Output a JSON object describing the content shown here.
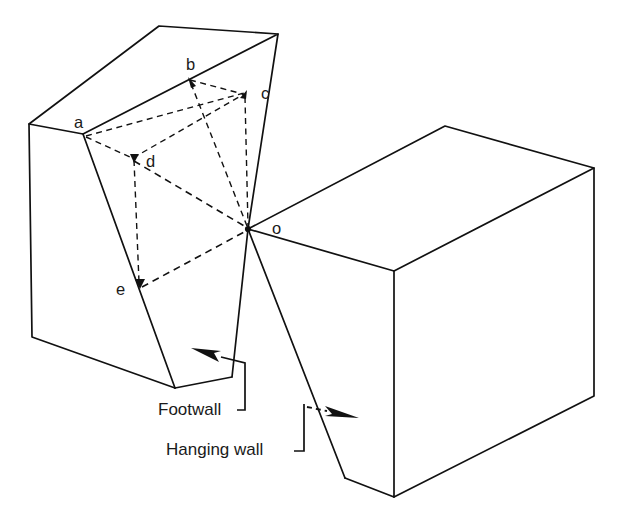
{
  "figure": {
    "kind": "geological-fault-block-diagram",
    "background_color": "#ffffff",
    "line_color": "#111111"
  },
  "vertex_labels": [
    {
      "id": "a",
      "text": "a",
      "x": 74,
      "y": 128
    },
    {
      "id": "b",
      "text": "b",
      "x": 186,
      "y": 70
    },
    {
      "id": "c",
      "text": "c",
      "x": 261,
      "y": 99
    },
    {
      "id": "d",
      "text": "d",
      "x": 146,
      "y": 167
    },
    {
      "id": "e",
      "text": "e",
      "x": 116,
      "y": 295
    },
    {
      "id": "o",
      "text": "o",
      "x": 272,
      "y": 234
    }
  ],
  "callouts": [
    {
      "id": "footwall",
      "text": "Footwall",
      "x": 158,
      "y": 415
    },
    {
      "id": "hanging-wall",
      "text": "Hanging wall",
      "x": 166,
      "y": 455
    }
  ],
  "blocks": [
    {
      "id": "footwall-block",
      "name": "Footwall block"
    },
    {
      "id": "hanging-wall-block",
      "name": "Hanging wall block"
    }
  ]
}
